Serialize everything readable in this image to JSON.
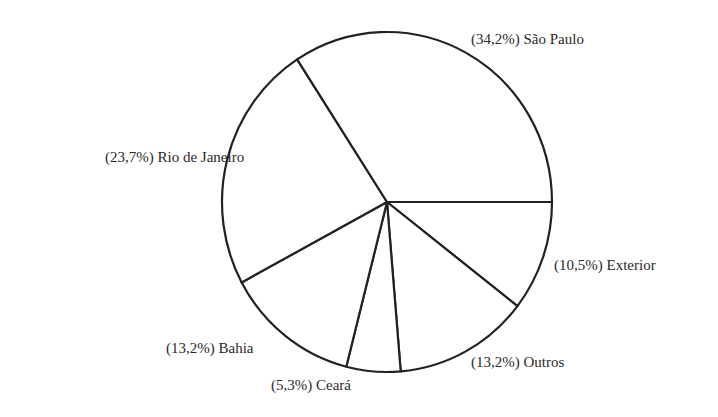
{
  "chart_data": {
    "type": "pie",
    "title": "",
    "start_angle_deg": 0,
    "direction": "clockwise",
    "slices": [
      {
        "name": "Exterior",
        "value": 10.5,
        "label": "(10,5%) Exterior"
      },
      {
        "name": "Outros",
        "value": 13.2,
        "label": "(13,2%) Outros"
      },
      {
        "name": "Ceará",
        "value": 5.3,
        "label": "(5,3%) Ceará"
      },
      {
        "name": "Bahia",
        "value": 13.2,
        "label": "(13,2%) Bahia"
      },
      {
        "name": "Rio de Janeiro",
        "value": 23.7,
        "label": "(23,7%) Rio de Janeiro"
      },
      {
        "name": "São Paulo",
        "value": 34.2,
        "label": "(34,2%) São Paulo"
      }
    ],
    "legend": "none",
    "fill": "#ffffff",
    "stroke": "#222222"
  },
  "labels": {
    "sao_paulo": "(34,2%) São Paulo",
    "rio": "(23,7%) Rio de Janeiro",
    "exterior": "(10,5%) Exterior",
    "bahia": "(13,2%) Bahia",
    "ceara": "(5,3%) Ceará",
    "outros": "(13,2%) Outros"
  }
}
